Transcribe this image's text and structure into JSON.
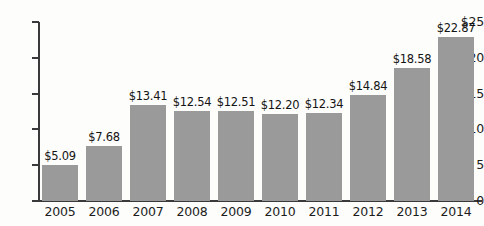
{
  "chart_data": {
    "type": "bar",
    "title": "",
    "subtitle": "",
    "xlabel": "",
    "ylabel": "",
    "categories": [
      "2005",
      "2006",
      "2007",
      "2008",
      "2009",
      "2010",
      "2011",
      "2012",
      "2013",
      "2014"
    ],
    "values": [
      5.09,
      7.68,
      13.41,
      12.54,
      12.51,
      12.2,
      12.34,
      14.84,
      18.58,
      22.87
    ],
    "data_labels": [
      "$5.09",
      "$7.68",
      "$13.41",
      "$12.54",
      "$12.51",
      "$12.20",
      "$12.34",
      "$14.84",
      "$18.58",
      "$22.87"
    ],
    "ytick_values": [
      25,
      20,
      15,
      10,
      5,
      0
    ],
    "ytick_labels": [
      "$25",
      "20",
      "15",
      "10",
      "5",
      "0"
    ],
    "ylim": [
      0,
      25
    ],
    "grid": false,
    "legend": null,
    "series": [
      {
        "name": "",
        "values": [
          5.09,
          7.68,
          13.41,
          12.54,
          12.51,
          12.2,
          12.34,
          14.84,
          18.58,
          22.87
        ],
        "color": "#9a9a9a"
      }
    ],
    "colors": {
      "bar": "#9a9a9a",
      "axis": "#3a3a3a",
      "text": "#1c1c1c",
      "background": "#fdfdfb"
    }
  }
}
